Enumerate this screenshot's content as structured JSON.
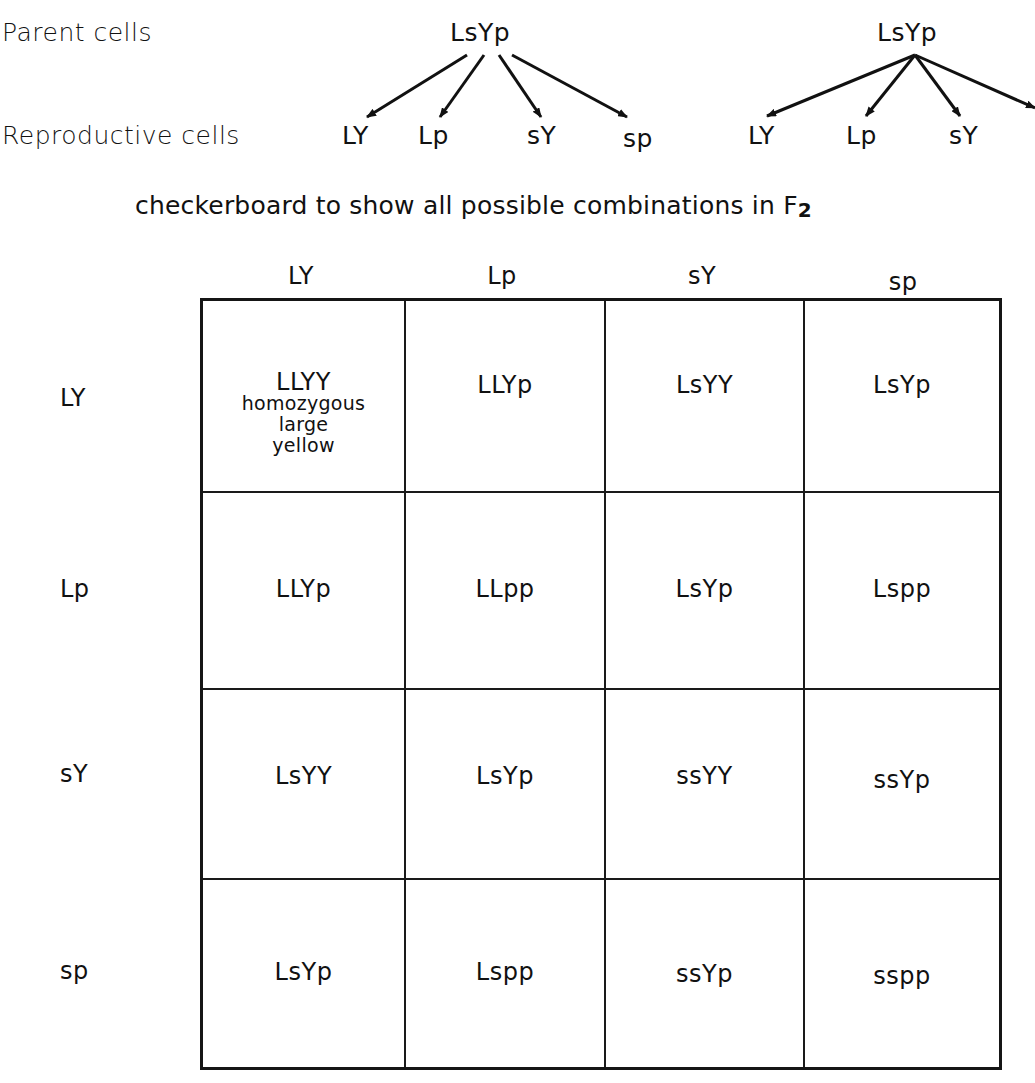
{
  "labels": {
    "parent_cells": "Parent cells",
    "reproductive_cells": "Reproductive cells",
    "caption_prefix": "checkerboard to show all possible combinations in ",
    "caption_generation": "F",
    "caption_generation_sub": "2"
  },
  "parents": [
    {
      "genotype": "LsYp",
      "gametes": [
        "LY",
        "Lp",
        "sY",
        "sp"
      ]
    },
    {
      "genotype": "LsYp",
      "gametes": [
        "LY",
        "Lp",
        "sY",
        "sp"
      ]
    }
  ],
  "checkerboard": {
    "column_headers": [
      "LY",
      "Lp",
      "sY",
      "sp"
    ],
    "row_headers": [
      "LY",
      "Lp",
      "sY",
      "sp"
    ],
    "cells": [
      [
        "LLYY",
        "LLYp",
        "LsYY",
        "LsYp"
      ],
      [
        "LLYp",
        "LLpp",
        "LsYp",
        "Lspp"
      ],
      [
        "LsYY",
        "LsYp",
        "ssYY",
        "ssYp"
      ],
      [
        "LsYp",
        "Lspp",
        "ssYp",
        "sspp"
      ]
    ],
    "annotations": {
      "r0c0": [
        "homozygous",
        "large",
        "yellow"
      ]
    }
  },
  "colors": {
    "ink": "#111111",
    "background": "#ffffff"
  }
}
